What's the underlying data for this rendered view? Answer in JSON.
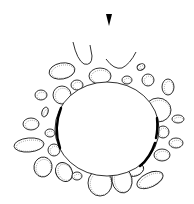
{
  "figure": {
    "type": "line-drawing",
    "background": "#ffffff",
    "stroke_color": "#1a1a1a",
    "arrowhead": {
      "x": 109,
      "y": 20,
      "direction": "down"
    },
    "central_body": {
      "cx": 107,
      "cy": 129,
      "rx": 52,
      "ry": 47
    },
    "thick_membrane_segments": [
      "M61,108 Q53,128 60,148",
      "M157,118 Q158,130 156,138",
      "M155,143 Q150,158 140,166"
    ],
    "open_cells": [
      "M73,42 Q77,60 84,64 Q92,66 92,56 L90,45",
      "M106,59 Q114,70 122,68 Q130,64 136,52"
    ],
    "cells": [
      {
        "cx": 62,
        "cy": 71,
        "rx": 13,
        "ry": 8,
        "rot": -10
      },
      {
        "cx": 100,
        "cy": 76,
        "rx": 11,
        "ry": 8,
        "rot": 0
      },
      {
        "cx": 77,
        "cy": 85,
        "rx": 6,
        "ry": 5,
        "rot": 0
      },
      {
        "cx": 127,
        "cy": 80,
        "rx": 5,
        "ry": 4,
        "rot": 0
      },
      {
        "cx": 141,
        "cy": 67,
        "rx": 4,
        "ry": 3,
        "rot": -25
      },
      {
        "cx": 148,
        "cy": 80,
        "rx": 6,
        "ry": 6,
        "rot": 0
      },
      {
        "cx": 168,
        "cy": 87,
        "rx": 6,
        "ry": 8,
        "rot": 0
      },
      {
        "cx": 62,
        "cy": 95,
        "rx": 9,
        "ry": 9,
        "rot": 0
      },
      {
        "cx": 41,
        "cy": 95,
        "rx": 6,
        "ry": 5,
        "rot": 0
      },
      {
        "cx": 45,
        "cy": 112,
        "rx": 3,
        "ry": 5,
        "rot": 20
      },
      {
        "cx": 158,
        "cy": 110,
        "rx": 13,
        "ry": 12,
        "rot": 0
      },
      {
        "cx": 31,
        "cy": 124,
        "rx": 8,
        "ry": 6,
        "rot": 0
      },
      {
        "cx": 50,
        "cy": 133,
        "rx": 5,
        "ry": 4,
        "rot": 0
      },
      {
        "cx": 178,
        "cy": 119,
        "rx": 6,
        "ry": 4,
        "rot": 0
      },
      {
        "cx": 163,
        "cy": 132,
        "rx": 6,
        "ry": 6,
        "rot": 0
      },
      {
        "cx": 29,
        "cy": 145,
        "rx": 15,
        "ry": 7,
        "rot": -5
      },
      {
        "cx": 54,
        "cy": 150,
        "rx": 6,
        "ry": 6,
        "rot": 0
      },
      {
        "cx": 176,
        "cy": 143,
        "rx": 7,
        "ry": 5,
        "rot": 0
      },
      {
        "cx": 162,
        "cy": 155,
        "rx": 8,
        "ry": 6,
        "rot": 0
      },
      {
        "cx": 43,
        "cy": 167,
        "rx": 9,
        "ry": 10,
        "rot": 10
      },
      {
        "cx": 64,
        "cy": 172,
        "rx": 8,
        "ry": 10,
        "rot": -30
      },
      {
        "cx": 77,
        "cy": 176,
        "rx": 5,
        "ry": 4,
        "rot": 0
      },
      {
        "cx": 135,
        "cy": 170,
        "rx": 9,
        "ry": 6,
        "rot": -20
      },
      {
        "cx": 100,
        "cy": 183,
        "rx": 12,
        "ry": 13,
        "rot": 0
      },
      {
        "cx": 122,
        "cy": 180,
        "rx": 10,
        "ry": 13,
        "rot": -10
      },
      {
        "cx": 150,
        "cy": 180,
        "rx": 14,
        "ry": 7,
        "rot": -25
      }
    ]
  }
}
